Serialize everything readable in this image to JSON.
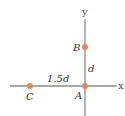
{
  "diagram": {
    "axes": {
      "x_label": "x",
      "y_label": "y",
      "line_color": "#8a8a8a"
    },
    "points": [
      {
        "name": "A",
        "label": "A",
        "x": 85,
        "y": 86
      },
      {
        "name": "B",
        "label": "B",
        "x": 85,
        "y": 47
      },
      {
        "name": "C",
        "label": "C",
        "x": 30,
        "y": 86
      }
    ],
    "distances": {
      "AB": "d",
      "AC": "1.5d"
    },
    "point_color": "#e8845a"
  }
}
